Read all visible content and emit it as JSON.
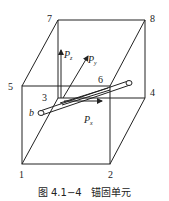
{
  "figure": {
    "caption": "图 4.1−4   锚固单元",
    "node_labels": [
      "1",
      "2",
      "3",
      "4",
      "5",
      "6",
      "7",
      "8"
    ],
    "end_label": "b",
    "forces": {
      "pz": {
        "main": "P",
        "sub": "z"
      },
      "py": {
        "main": "P",
        "sub": "y"
      },
      "px": {
        "main": "P",
        "sub": "x"
      }
    }
  }
}
